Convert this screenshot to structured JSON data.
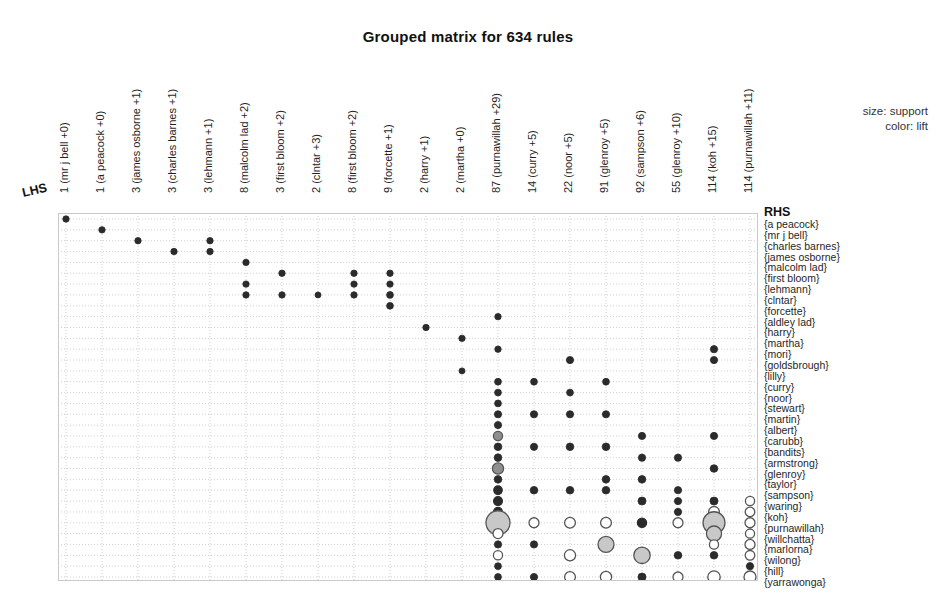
{
  "title": "Grouped matrix for 634 rules",
  "legend": {
    "size": "size: support",
    "color": "color: lift"
  },
  "axes": {
    "lhs_label": "LHS",
    "rhs_label": "RHS"
  },
  "colors": {
    "grid": "#cfcfcf",
    "frame": "#c9c9c9",
    "bubble_dark": "#2b2b2b",
    "bubble_mid": "#8f8f8f",
    "bubble_light": "#c8c8c8",
    "bubble_open": "#ffffff",
    "bubble_stroke": "#555555",
    "text": "#1f1f1f"
  },
  "chart_data": {
    "type": "scatter",
    "title": "Grouped matrix for 634 rules",
    "xlabel": "LHS",
    "ylabel": "RHS",
    "grid": true,
    "legend_position": "top-right",
    "size_encodes": "support",
    "color_encodes": "lift",
    "columns": [
      "1 (mr j bell +0)",
      "1 (a peacock +0)",
      "3 (james osborne +1)",
      "3 (charles barnes +1)",
      "3 (lehmann +1)",
      "8 (malcolm lad +2)",
      "3 (first bloom +2)",
      "2 (clntar +3)",
      "8 (first bloom +2)",
      "9 (forcette +1)",
      "2 (harry +1)",
      "2 (martha +0)",
      "87 (purnawillah +29)",
      "14 (curry +5)",
      "22 (noor +5)",
      "91 (glenroy +5)",
      "92 (sampson +6)",
      "55 (glenroy +10)",
      "114 (koh +15)",
      "114 (purnawillah +11)"
    ],
    "rows": [
      "{a peacock}",
      "{mr j bell}",
      "{charles barnes}",
      "{james osborne}",
      "{malcolm lad}",
      "{first bloom}",
      "{lehmann}",
      "{clntar}",
      "{forcette}",
      "{aldley lad}",
      "{harry}",
      "{martha}",
      "{mori}",
      "{goldsbrough}",
      "{lilly}",
      "{curry}",
      "{noor}",
      "{stewart}",
      "{martin}",
      "{albert}",
      "{carubb}",
      "{bandits}",
      "{armstrong}",
      "{glenroy}",
      "{taylor}",
      "{sampson}",
      "{waring}",
      "{koh}",
      "{purnawillah}",
      "{willchatta}",
      "{marlorna}",
      "{wilong}",
      "{hill}",
      "{yarrawonga}"
    ],
    "points": [
      {
        "c": 0,
        "r": 0,
        "size": 3.2,
        "lift": "high"
      },
      {
        "c": 1,
        "r": 1,
        "size": 3.2,
        "lift": "high"
      },
      {
        "c": 2,
        "r": 2,
        "size": 3.2,
        "lift": "high"
      },
      {
        "c": 3,
        "r": 3,
        "size": 3.2,
        "lift": "high"
      },
      {
        "c": 4,
        "r": 2,
        "size": 3.2,
        "lift": "high"
      },
      {
        "c": 4,
        "r": 3,
        "size": 3.2,
        "lift": "high"
      },
      {
        "c": 5,
        "r": 4,
        "size": 3.2,
        "lift": "high"
      },
      {
        "c": 5,
        "r": 6,
        "size": 3.2,
        "lift": "high"
      },
      {
        "c": 5,
        "r": 7,
        "size": 3.2,
        "lift": "high"
      },
      {
        "c": 6,
        "r": 5,
        "size": 3.2,
        "lift": "high"
      },
      {
        "c": 6,
        "r": 7,
        "size": 3.2,
        "lift": "high"
      },
      {
        "c": 7,
        "r": 7,
        "size": 3.0,
        "lift": "high"
      },
      {
        "c": 8,
        "r": 5,
        "size": 3.2,
        "lift": "high"
      },
      {
        "c": 8,
        "r": 6,
        "size": 3.2,
        "lift": "high"
      },
      {
        "c": 8,
        "r": 7,
        "size": 3.2,
        "lift": "high"
      },
      {
        "c": 9,
        "r": 5,
        "size": 3.2,
        "lift": "high"
      },
      {
        "c": 9,
        "r": 6,
        "size": 3.2,
        "lift": "high"
      },
      {
        "c": 9,
        "r": 7,
        "size": 3.4,
        "lift": "high"
      },
      {
        "c": 9,
        "r": 8,
        "size": 3.4,
        "lift": "high"
      },
      {
        "c": 10,
        "r": 10,
        "size": 3.2,
        "lift": "high"
      },
      {
        "c": 11,
        "r": 11,
        "size": 3.2,
        "lift": "high"
      },
      {
        "c": 11,
        "r": 14,
        "size": 3.0,
        "lift": "high"
      },
      {
        "c": 12,
        "r": 9,
        "size": 3.2,
        "lift": "high"
      },
      {
        "c": 12,
        "r": 12,
        "size": 3.2,
        "lift": "high"
      },
      {
        "c": 12,
        "r": 15,
        "size": 3.4,
        "lift": "high"
      },
      {
        "c": 12,
        "r": 16,
        "size": 3.4,
        "lift": "high"
      },
      {
        "c": 12,
        "r": 17,
        "size": 3.4,
        "lift": "high"
      },
      {
        "c": 12,
        "r": 18,
        "size": 3.6,
        "lift": "high"
      },
      {
        "c": 12,
        "r": 19,
        "size": 3.6,
        "lift": "high"
      },
      {
        "c": 12,
        "r": 20,
        "size": 4.6,
        "lift": "mid"
      },
      {
        "c": 12,
        "r": 21,
        "size": 3.8,
        "lift": "high"
      },
      {
        "c": 12,
        "r": 22,
        "size": 3.8,
        "lift": "high"
      },
      {
        "c": 12,
        "r": 23,
        "size": 5.6,
        "lift": "mid"
      },
      {
        "c": 12,
        "r": 24,
        "size": 3.8,
        "lift": "high"
      },
      {
        "c": 12,
        "r": 25,
        "size": 4.2,
        "lift": "high"
      },
      {
        "c": 12,
        "r": 26,
        "size": 4.4,
        "lift": "high"
      },
      {
        "c": 12,
        "r": 27,
        "size": 4.4,
        "lift": "high"
      },
      {
        "c": 12,
        "r": 28,
        "size": 12.0,
        "lift": "light"
      },
      {
        "c": 12,
        "r": 29,
        "size": 5.0,
        "lift": "open"
      },
      {
        "c": 12,
        "r": 30,
        "size": 3.6,
        "lift": "high"
      },
      {
        "c": 12,
        "r": 31,
        "size": 4.6,
        "lift": "open"
      },
      {
        "c": 12,
        "r": 32,
        "size": 3.4,
        "lift": "high"
      },
      {
        "c": 12,
        "r": 33,
        "size": 3.4,
        "lift": "high"
      },
      {
        "c": 13,
        "r": 15,
        "size": 3.4,
        "lift": "high"
      },
      {
        "c": 13,
        "r": 18,
        "size": 3.6,
        "lift": "high"
      },
      {
        "c": 13,
        "r": 21,
        "size": 3.6,
        "lift": "high"
      },
      {
        "c": 13,
        "r": 25,
        "size": 3.8,
        "lift": "high"
      },
      {
        "c": 13,
        "r": 28,
        "size": 5.0,
        "lift": "open"
      },
      {
        "c": 13,
        "r": 30,
        "size": 3.6,
        "lift": "high"
      },
      {
        "c": 13,
        "r": 33,
        "size": 3.6,
        "lift": "high"
      },
      {
        "c": 14,
        "r": 13,
        "size": 3.6,
        "lift": "high"
      },
      {
        "c": 14,
        "r": 16,
        "size": 3.4,
        "lift": "high"
      },
      {
        "c": 14,
        "r": 18,
        "size": 3.6,
        "lift": "high"
      },
      {
        "c": 14,
        "r": 21,
        "size": 3.8,
        "lift": "high"
      },
      {
        "c": 14,
        "r": 25,
        "size": 3.8,
        "lift": "high"
      },
      {
        "c": 14,
        "r": 28,
        "size": 5.4,
        "lift": "open"
      },
      {
        "c": 14,
        "r": 31,
        "size": 5.6,
        "lift": "open"
      },
      {
        "c": 14,
        "r": 33,
        "size": 5.4,
        "lift": "open"
      },
      {
        "c": 15,
        "r": 15,
        "size": 3.4,
        "lift": "high"
      },
      {
        "c": 15,
        "r": 18,
        "size": 3.6,
        "lift": "high"
      },
      {
        "c": 15,
        "r": 21,
        "size": 3.8,
        "lift": "high"
      },
      {
        "c": 15,
        "r": 24,
        "size": 3.8,
        "lift": "high"
      },
      {
        "c": 15,
        "r": 25,
        "size": 3.8,
        "lift": "high"
      },
      {
        "c": 15,
        "r": 28,
        "size": 5.4,
        "lift": "open"
      },
      {
        "c": 15,
        "r": 30,
        "size": 8.0,
        "lift": "light"
      },
      {
        "c": 15,
        "r": 33,
        "size": 5.6,
        "lift": "open"
      },
      {
        "c": 16,
        "r": 20,
        "size": 3.6,
        "lift": "high"
      },
      {
        "c": 16,
        "r": 22,
        "size": 3.6,
        "lift": "high"
      },
      {
        "c": 16,
        "r": 24,
        "size": 3.8,
        "lift": "high"
      },
      {
        "c": 16,
        "r": 26,
        "size": 4.0,
        "lift": "high"
      },
      {
        "c": 16,
        "r": 28,
        "size": 4.6,
        "lift": "high"
      },
      {
        "c": 16,
        "r": 31,
        "size": 8.2,
        "lift": "light"
      },
      {
        "c": 16,
        "r": 33,
        "size": 4.0,
        "lift": "high"
      },
      {
        "c": 17,
        "r": 22,
        "size": 3.6,
        "lift": "high"
      },
      {
        "c": 17,
        "r": 25,
        "size": 3.6,
        "lift": "high"
      },
      {
        "c": 17,
        "r": 26,
        "size": 3.6,
        "lift": "high"
      },
      {
        "c": 17,
        "r": 27,
        "size": 3.6,
        "lift": "high"
      },
      {
        "c": 17,
        "r": 28,
        "size": 5.0,
        "lift": "open"
      },
      {
        "c": 17,
        "r": 31,
        "size": 3.8,
        "lift": "high"
      },
      {
        "c": 17,
        "r": 33,
        "size": 5.0,
        "lift": "open"
      },
      {
        "c": 18,
        "r": 12,
        "size": 3.6,
        "lift": "high"
      },
      {
        "c": 18,
        "r": 13,
        "size": 3.6,
        "lift": "high"
      },
      {
        "c": 18,
        "r": 20,
        "size": 3.6,
        "lift": "high"
      },
      {
        "c": 18,
        "r": 23,
        "size": 3.8,
        "lift": "high"
      },
      {
        "c": 18,
        "r": 26,
        "size": 4.0,
        "lift": "high"
      },
      {
        "c": 18,
        "r": 27,
        "size": 5.4,
        "lift": "open"
      },
      {
        "c": 18,
        "r": 28,
        "size": 11.0,
        "lift": "light"
      },
      {
        "c": 18,
        "r": 29,
        "size": 7.6,
        "lift": "light"
      },
      {
        "c": 18,
        "r": 30,
        "size": 4.6,
        "lift": "open"
      },
      {
        "c": 18,
        "r": 31,
        "size": 3.8,
        "lift": "high"
      },
      {
        "c": 18,
        "r": 33,
        "size": 6.2,
        "lift": "open"
      },
      {
        "c": 19,
        "r": 26,
        "size": 4.6,
        "lift": "open"
      },
      {
        "c": 19,
        "r": 27,
        "size": 4.8,
        "lift": "open"
      },
      {
        "c": 19,
        "r": 28,
        "size": 5.0,
        "lift": "open"
      },
      {
        "c": 19,
        "r": 29,
        "size": 4.6,
        "lift": "open"
      },
      {
        "c": 19,
        "r": 30,
        "size": 5.0,
        "lift": "open"
      },
      {
        "c": 19,
        "r": 31,
        "size": 4.8,
        "lift": "open"
      },
      {
        "c": 19,
        "r": 32,
        "size": 3.6,
        "lift": "high"
      },
      {
        "c": 19,
        "r": 33,
        "size": 6.0,
        "lift": "open"
      }
    ]
  }
}
